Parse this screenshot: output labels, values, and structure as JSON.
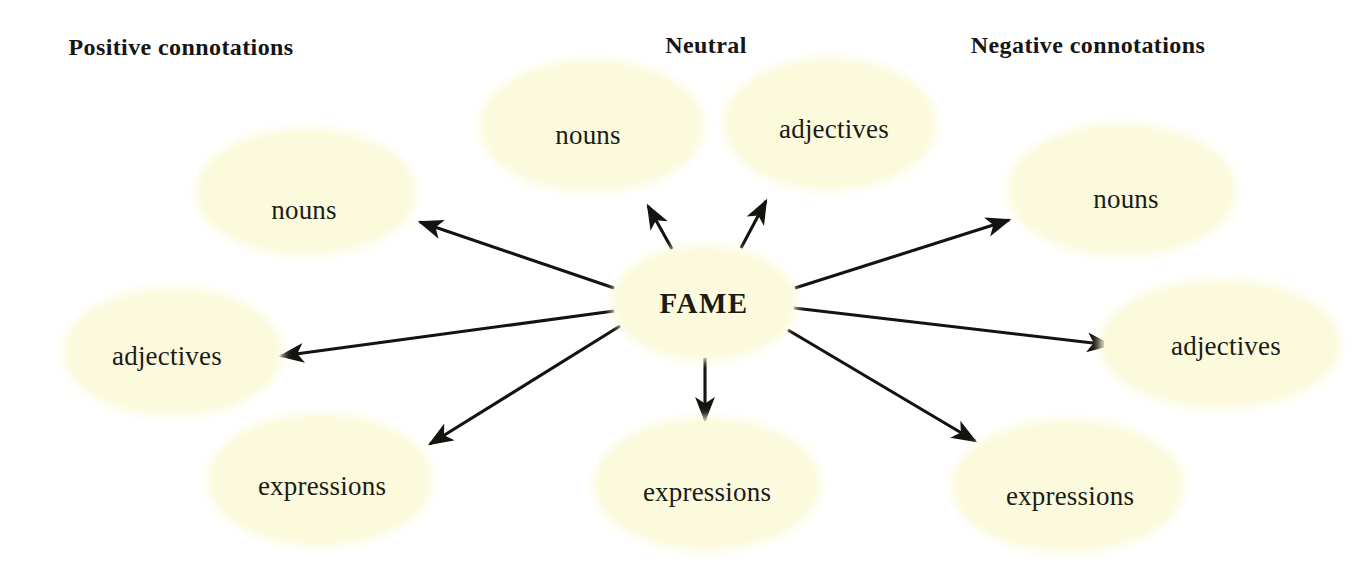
{
  "diagram": {
    "type": "word-web",
    "title_node": "FAME",
    "background_color": "#ffffff",
    "node_fill_color": "#fbfadc",
    "text_color": "#1a1a18",
    "arrow_color": "#14130f",
    "headings": [
      {
        "id": "positive",
        "label": "Positive connotations"
      },
      {
        "id": "neutral",
        "label": "Neutral"
      },
      {
        "id": "negative",
        "label": "Negative connotations"
      }
    ],
    "center": {
      "label": "FAME"
    },
    "branches": [
      {
        "id": "pos-nouns",
        "group": "positive",
        "label": "nouns"
      },
      {
        "id": "pos-adjectives",
        "group": "positive",
        "label": "adjectives"
      },
      {
        "id": "pos-expressions",
        "group": "positive",
        "label": "expressions"
      },
      {
        "id": "neu-nouns",
        "group": "neutral",
        "label": "nouns"
      },
      {
        "id": "neu-adjectives",
        "group": "neutral",
        "label": "adjectives"
      },
      {
        "id": "neu-expressions",
        "group": "neutral",
        "label": "expressions"
      },
      {
        "id": "neg-nouns",
        "group": "negative",
        "label": "nouns"
      },
      {
        "id": "neg-adjectives",
        "group": "negative",
        "label": "adjectives"
      },
      {
        "id": "neg-expressions",
        "group": "negative",
        "label": "expressions"
      }
    ],
    "connections": [
      {
        "from": "FAME",
        "to": "pos-nouns",
        "x1": 614,
        "y1": 288,
        "x2": 420,
        "y2": 222
      },
      {
        "from": "FAME",
        "to": "pos-adjectives",
        "x1": 614,
        "y1": 311,
        "x2": 281,
        "y2": 356
      },
      {
        "from": "FAME",
        "to": "pos-expressions",
        "x1": 620,
        "y1": 326,
        "x2": 430,
        "y2": 444
      },
      {
        "from": "FAME",
        "to": "neu-nouns",
        "x1": 672,
        "y1": 249,
        "x2": 648,
        "y2": 206
      },
      {
        "from": "FAME",
        "to": "neu-adjectives",
        "x1": 741,
        "y1": 248,
        "x2": 766,
        "y2": 201
      },
      {
        "from": "FAME",
        "to": "neu-expressions",
        "x1": 705,
        "y1": 358,
        "x2": 705,
        "y2": 420
      },
      {
        "from": "FAME",
        "to": "neg-nouns",
        "x1": 795,
        "y1": 288,
        "x2": 1009,
        "y2": 220
      },
      {
        "from": "FAME",
        "to": "neg-adjectives",
        "x1": 794,
        "y1": 308,
        "x2": 1110,
        "y2": 345
      },
      {
        "from": "FAME",
        "to": "neg-expressions",
        "x1": 788,
        "y1": 330,
        "x2": 975,
        "y2": 441
      }
    ]
  }
}
